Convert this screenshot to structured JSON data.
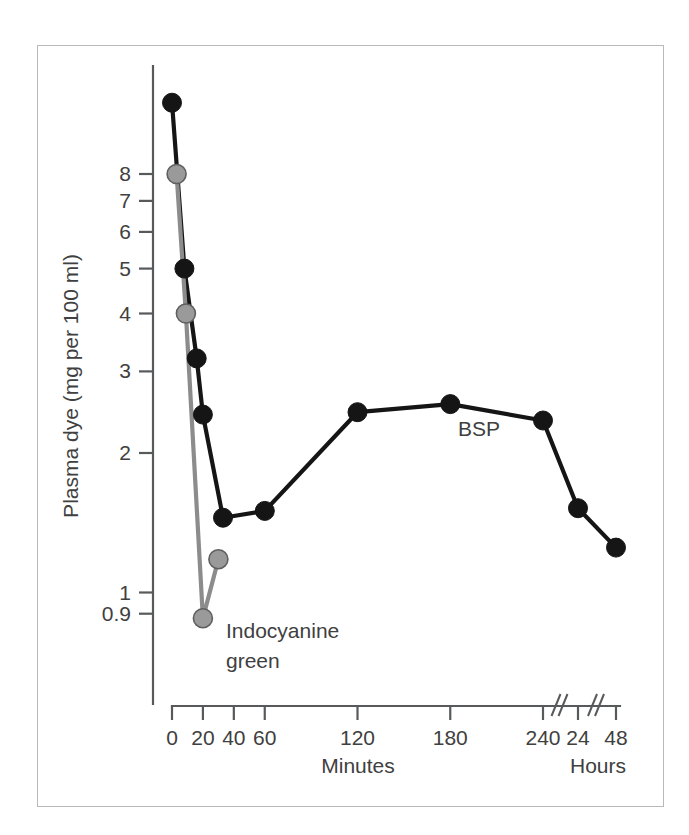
{
  "figure": {
    "background_color": "#ffffff",
    "frame_color": "#b9b9b9"
  },
  "chart_data": {
    "type": "line",
    "title": "",
    "xlabel": "Minutes",
    "xlabel_secondary": "Hours",
    "ylabel": "Plasma dye (mg per 100 ml)",
    "yscale": "log",
    "ylim": [
      0.85,
      12.5
    ],
    "y_tick_labels": [
      "8",
      "7",
      "6",
      "5",
      "4",
      "3",
      "2",
      "1",
      "0.9"
    ],
    "y_tick_values": [
      8,
      7,
      6,
      5,
      4,
      3,
      2,
      1,
      0.9
    ],
    "x_tick_labels": [
      "0",
      "20",
      "40",
      "60",
      "120",
      "180",
      "240",
      "24",
      "48"
    ],
    "x_tick_values": [
      0,
      20,
      40,
      60,
      120,
      180,
      240,
      1440,
      2880
    ],
    "x_axis_breaks": [
      "between-240-and-24",
      "between-24-and-48"
    ],
    "grid": false,
    "legend_position": "inline-annotation",
    "series": [
      {
        "name": "BSP",
        "color": "#151515",
        "marker": "filled-circle",
        "label_text": "BSP",
        "points": [
          {
            "x_label": "0",
            "x": 0,
            "y": 11.4
          },
          {
            "x_label": "8",
            "x": 8,
            "y": 5.0
          },
          {
            "x_label": "16",
            "x": 16,
            "y": 3.2
          },
          {
            "x_label": "20",
            "x": 20,
            "y": 2.42
          },
          {
            "x_label": "33",
            "x": 33,
            "y": 1.45
          },
          {
            "x_label": "60",
            "x": 60,
            "y": 1.5
          },
          {
            "x_label": "120",
            "x": 120,
            "y": 2.45
          },
          {
            "x_label": "180",
            "x": 180,
            "y": 2.55
          },
          {
            "x_label": "240",
            "x": 240,
            "y": 2.35
          },
          {
            "x_label": "24 h",
            "x": 1440,
            "y": 1.52
          },
          {
            "x_label": "48 h",
            "x": 2880,
            "y": 1.25
          }
        ]
      },
      {
        "name": "Indocyanine green",
        "color": "#9a9a9a",
        "marker": "filled-circle",
        "label_text": "Indocyanine green",
        "label_line_1": "Indocyanine",
        "label_line_2": "green",
        "points": [
          {
            "x_label": "3",
            "x": 3,
            "y": 8.0
          },
          {
            "x_label": "9",
            "x": 9,
            "y": 4.0
          },
          {
            "x_label": "20",
            "x": 20,
            "y": 0.88
          },
          {
            "x_label": "30",
            "x": 30,
            "y": 1.18
          }
        ]
      }
    ]
  }
}
